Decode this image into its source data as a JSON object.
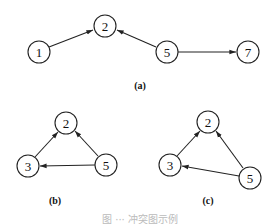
{
  "figure": {
    "panels": [
      {
        "label": "(a)",
        "nodes": [
          {
            "id": "1",
            "label": "1"
          },
          {
            "id": "2",
            "label": "2"
          },
          {
            "id": "5",
            "label": "5"
          },
          {
            "id": "7",
            "label": "7"
          }
        ],
        "edges": [
          {
            "from": "1",
            "to": "2"
          },
          {
            "from": "5",
            "to": "2"
          },
          {
            "from": "5",
            "to": "7"
          }
        ]
      },
      {
        "label": "(b)",
        "nodes": [
          {
            "id": "2",
            "label": "2"
          },
          {
            "id": "3",
            "label": "3"
          },
          {
            "id": "5",
            "label": "5"
          }
        ],
        "edges": [
          {
            "from": "3",
            "to": "2"
          },
          {
            "from": "5",
            "to": "2"
          },
          {
            "from": "5",
            "to": "3"
          }
        ]
      },
      {
        "label": "(c)",
        "nodes": [
          {
            "id": "2",
            "label": "2"
          },
          {
            "id": "3",
            "label": "3"
          },
          {
            "id": "5",
            "label": "5"
          }
        ],
        "edges": [
          {
            "from": "3",
            "to": "2"
          },
          {
            "from": "5",
            "to": "2"
          },
          {
            "from": "5",
            "to": "3"
          }
        ]
      }
    ],
    "caption": "图 ··· 冲突图示例"
  }
}
